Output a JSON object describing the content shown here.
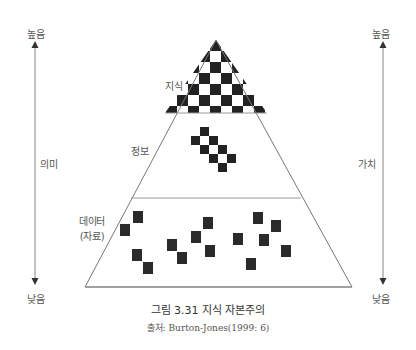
{
  "diagram": {
    "type": "knowledge-pyramid",
    "layers": [
      {
        "id": "knowledge",
        "label": "지식",
        "pattern": "checkerboard"
      },
      {
        "id": "information",
        "label": "정보",
        "pattern": "diagonal-staircase"
      },
      {
        "id": "data",
        "label_line1": "데이터",
        "label_line2": "(자료)",
        "pattern": "scattered-squares"
      }
    ],
    "left_axis": {
      "top": "높음",
      "middle": "의미",
      "bottom": "낮음"
    },
    "right_axis": {
      "top": "높음",
      "middle": "가치",
      "bottom": "낮음"
    },
    "colors": {
      "line": "#888888",
      "fill": "#222222",
      "arrow": "#444444"
    }
  },
  "caption": "그림 3.31 지식 자본주의",
  "source": "출처: Burton-Jones(1999: 6)"
}
